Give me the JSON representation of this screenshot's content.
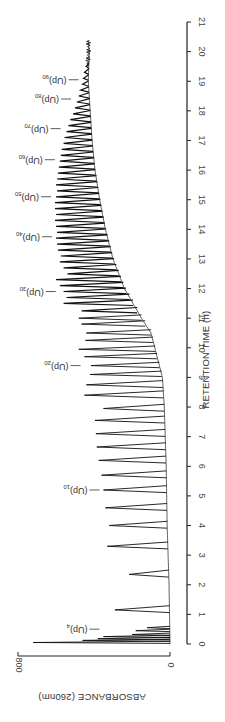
{
  "chart_data": {
    "type": "line",
    "orientation": "rotated-90-clockwise",
    "title": "",
    "xlabel": "RETENTION TIME (h)",
    "ylabel": "ABSORBANCE (260nm)",
    "xlim": [
      0,
      21
    ],
    "ylim": [
      0,
      800
    ],
    "x_ticks": [
      0,
      1,
      2,
      3,
      4,
      5,
      6,
      7,
      8,
      9,
      10,
      11,
      12,
      13,
      14,
      15,
      16,
      17,
      18,
      19,
      20,
      21
    ],
    "y_ticks": [
      0,
      800
    ],
    "grid": false,
    "legend": "none",
    "series": [
      {
        "name": "chromatogram",
        "peaks": [
          {
            "t": 0.05,
            "a": 720
          },
          {
            "t": 0.12,
            "a": 460
          },
          {
            "t": 0.18,
            "a": 380
          },
          {
            "t": 0.25,
            "a": 350
          },
          {
            "t": 0.32,
            "a": 200
          },
          {
            "t": 0.45,
            "a": 180
          },
          {
            "t": 0.55,
            "a": 120
          },
          {
            "t": 1.15,
            "a": 290
          },
          {
            "t": 2.35,
            "a": 215
          },
          {
            "t": 3.3,
            "a": 330
          },
          {
            "t": 4.0,
            "a": 320
          },
          {
            "t": 4.6,
            "a": 340
          },
          {
            "t": 5.2,
            "a": 350
          },
          {
            "t": 5.7,
            "a": 360
          },
          {
            "t": 6.2,
            "a": 375
          },
          {
            "t": 6.65,
            "a": 385
          },
          {
            "t": 7.1,
            "a": 390
          },
          {
            "t": 7.55,
            "a": 395
          },
          {
            "t": 7.95,
            "a": 350
          },
          {
            "t": 8.4,
            "a": 450
          },
          {
            "t": 8.75,
            "a": 440
          },
          {
            "t": 9.1,
            "a": 420
          },
          {
            "t": 9.4,
            "a": 415
          },
          {
            "t": 9.7,
            "a": 450
          },
          {
            "t": 9.95,
            "a": 480
          },
          {
            "t": 10.25,
            "a": 445
          },
          {
            "t": 10.5,
            "a": 440
          },
          {
            "t": 10.8,
            "a": 465
          },
          {
            "t": 11.0,
            "a": 480
          },
          {
            "t": 11.25,
            "a": 465
          },
          {
            "t": 11.5,
            "a": 560
          },
          {
            "t": 11.7,
            "a": 545
          },
          {
            "t": 11.9,
            "a": 560
          },
          {
            "t": 12.1,
            "a": 580
          },
          {
            "t": 12.3,
            "a": 600
          },
          {
            "t": 12.5,
            "a": 540
          },
          {
            "t": 12.7,
            "a": 560
          },
          {
            "t": 12.9,
            "a": 580
          },
          {
            "t": 13.1,
            "a": 575
          },
          {
            "t": 13.3,
            "a": 590
          },
          {
            "t": 13.5,
            "a": 595
          },
          {
            "t": 13.7,
            "a": 600
          },
          {
            "t": 13.9,
            "a": 595
          },
          {
            "t": 14.1,
            "a": 600
          },
          {
            "t": 14.3,
            "a": 605
          },
          {
            "t": 14.5,
            "a": 600
          },
          {
            "t": 14.7,
            "a": 605
          },
          {
            "t": 14.9,
            "a": 605
          },
          {
            "t": 15.1,
            "a": 600
          },
          {
            "t": 15.3,
            "a": 595
          },
          {
            "t": 15.5,
            "a": 600
          },
          {
            "t": 15.7,
            "a": 595
          },
          {
            "t": 15.9,
            "a": 590
          },
          {
            "t": 16.1,
            "a": 585
          },
          {
            "t": 16.3,
            "a": 580
          },
          {
            "t": 16.5,
            "a": 575
          },
          {
            "t": 16.7,
            "a": 570
          },
          {
            "t": 16.9,
            "a": 560
          },
          {
            "t": 17.1,
            "a": 555
          },
          {
            "t": 17.3,
            "a": 545
          },
          {
            "t": 17.5,
            "a": 535
          },
          {
            "t": 17.7,
            "a": 525
          },
          {
            "t": 17.9,
            "a": 510
          },
          {
            "t": 18.1,
            "a": 500
          },
          {
            "t": 18.3,
            "a": 490
          },
          {
            "t": 18.5,
            "a": 480
          },
          {
            "t": 18.7,
            "a": 470
          },
          {
            "t": 18.9,
            "a": 460
          },
          {
            "t": 19.1,
            "a": 455
          },
          {
            "t": 19.3,
            "a": 450
          },
          {
            "t": 19.5,
            "a": 440
          }
        ],
        "baseline": [
          {
            "t": 0,
            "a": 0
          },
          {
            "t": 2,
            "a": 5
          },
          {
            "t": 4,
            "a": 15
          },
          {
            "t": 6,
            "a": 20
          },
          {
            "t": 8,
            "a": 30
          },
          {
            "t": 9,
            "a": 40
          },
          {
            "t": 10,
            "a": 80
          },
          {
            "t": 10.5,
            "a": 100
          },
          {
            "t": 11,
            "a": 150
          },
          {
            "t": 12,
            "a": 240
          },
          {
            "t": 13,
            "a": 300
          },
          {
            "t": 14,
            "a": 340
          },
          {
            "t": 15,
            "a": 370
          },
          {
            "t": 16,
            "a": 395
          },
          {
            "t": 17,
            "a": 410
          },
          {
            "t": 18,
            "a": 420
          },
          {
            "t": 19,
            "a": 430
          },
          {
            "t": 20,
            "a": 425
          },
          {
            "t": 20.4,
            "a": 430
          }
        ]
      }
    ],
    "annotations": [
      {
        "text": "(Up)",
        "sub": "4",
        "t": 0.5
      },
      {
        "text": "(Up)",
        "sub": "10",
        "t": 5.2
      },
      {
        "text": "(Up)",
        "sub": "20",
        "t": 9.4
      },
      {
        "text": "(Up)",
        "sub": "30",
        "t": 11.9
      },
      {
        "text": "(Up)",
        "sub": "40",
        "t": 13.75
      },
      {
        "text": "(Up)",
        "sub": "50",
        "t": 15.1
      },
      {
        "text": "(Up)",
        "sub": "60",
        "t": 16.35
      },
      {
        "text": "(Up)",
        "sub": "70",
        "t": 17.4
      },
      {
        "text": "(Up)",
        "sub": "80",
        "t": 18.4
      },
      {
        "text": "(Up)",
        "sub": "90",
        "t": 19.05
      }
    ]
  }
}
